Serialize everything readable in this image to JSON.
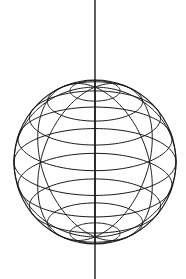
{
  "diagram": {
    "type": "wireframe-sphere",
    "stroke_color": "#1a1a1a",
    "background": "#ffffff",
    "sphere": {
      "cx": 95,
      "cy": 162,
      "rx": 81,
      "ry": 82
    },
    "axis": {
      "x": 95,
      "y1": 0,
      "y2": 279
    },
    "tilt": 0.42,
    "latitude_count": 9,
    "meridian_count": 4
  }
}
